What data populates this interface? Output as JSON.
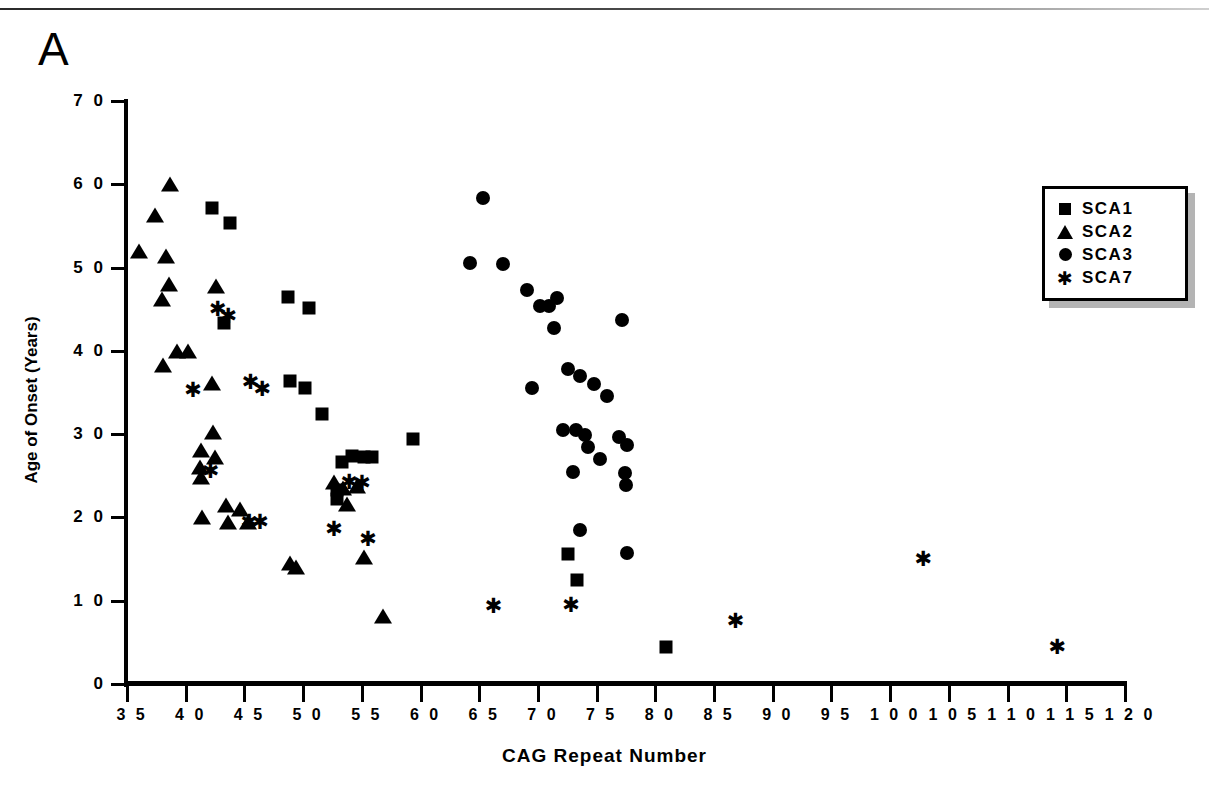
{
  "panel_label": "A",
  "chart_data": {
    "type": "scatter",
    "title": "",
    "xlabel": "CAG Repeat Number",
    "ylabel": "Age of Onset (Years)",
    "xlim": [
      35,
      120
    ],
    "ylim": [
      0,
      70
    ],
    "xticks": [
      35,
      40,
      45,
      50,
      55,
      60,
      65,
      70,
      75,
      80,
      85,
      90,
      95,
      100,
      105,
      110,
      115,
      120
    ],
    "yticks": [
      0,
      10,
      20,
      30,
      40,
      50,
      60,
      70
    ],
    "xtick_labels": [
      "3 5",
      "4 0",
      "4 5",
      "5 0",
      "5 5",
      "6 0",
      "6 5",
      "7 0",
      "7 5",
      "8 0",
      "8 5",
      "9 0",
      "9 5",
      "1 0 0",
      "1 0 5",
      "1 1 0",
      "1 1 5",
      "1 2 0"
    ],
    "ytick_labels": [
      "0",
      "1 0",
      "2 0",
      "3 0",
      "4 0",
      "5 0",
      "6 0",
      "7 0"
    ],
    "grid": false,
    "legend_position": "top-right",
    "series": [
      {
        "name": "SCA1",
        "marker": "square",
        "color": "#000000",
        "points": [
          [
            42.2,
            57.2
          ],
          [
            43.8,
            55.3
          ],
          [
            43.3,
            43.3
          ],
          [
            48.7,
            46.5
          ],
          [
            50.5,
            45.2
          ],
          [
            48.9,
            36.4
          ],
          [
            50.2,
            35.5
          ],
          [
            51.6,
            32.4
          ],
          [
            52.9,
            23.3
          ],
          [
            52.9,
            22.2
          ],
          [
            53.3,
            26.6
          ],
          [
            54.2,
            27.4
          ],
          [
            55.2,
            27.3
          ],
          [
            55.9,
            27.3
          ],
          [
            59.4,
            29.4
          ],
          [
            72.6,
            15.6
          ],
          [
            73.3,
            12.5
          ],
          [
            80.9,
            4.4
          ]
        ]
      },
      {
        "name": "SCA2",
        "marker": "triangle",
        "color": "#000000",
        "points": [
          [
            36.0,
            52.0
          ],
          [
            37.4,
            56.3
          ],
          [
            38.7,
            60.0
          ],
          [
            38.3,
            51.4
          ],
          [
            38.6,
            48.0
          ],
          [
            38.0,
            46.2
          ],
          [
            38.1,
            38.3
          ],
          [
            39.3,
            40.0
          ],
          [
            40.2,
            40.0
          ],
          [
            41.3,
            28.1
          ],
          [
            41.2,
            26.0
          ],
          [
            41.3,
            24.9
          ],
          [
            41.4,
            20.0
          ],
          [
            42.6,
            47.8
          ],
          [
            42.2,
            36.2
          ],
          [
            42.3,
            30.3
          ],
          [
            42.5,
            27.3
          ],
          [
            43.4,
            21.5
          ],
          [
            43.6,
            19.5
          ],
          [
            44.6,
            21.0
          ],
          [
            45.3,
            19.4
          ],
          [
            48.9,
            14.5
          ],
          [
            49.4,
            14.1
          ],
          [
            52.6,
            24.3
          ],
          [
            53.4,
            23.5
          ],
          [
            53.7,
            21.6
          ],
          [
            54.6,
            23.8
          ],
          [
            55.2,
            15.3
          ],
          [
            56.8,
            8.2
          ]
        ]
      },
      {
        "name": "SCA3",
        "marker": "circle",
        "color": "#000000",
        "points": [
          [
            65.3,
            58.4
          ],
          [
            64.2,
            50.5
          ],
          [
            67.0,
            50.4
          ],
          [
            69.1,
            47.3
          ],
          [
            70.2,
            45.4
          ],
          [
            70.9,
            45.4
          ],
          [
            71.6,
            46.4
          ],
          [
            71.4,
            42.7
          ],
          [
            77.2,
            43.7
          ],
          [
            69.5,
            35.6
          ],
          [
            72.6,
            37.8
          ],
          [
            73.6,
            37.0
          ],
          [
            74.8,
            36.0
          ],
          [
            75.9,
            34.6
          ],
          [
            72.1,
            30.5
          ],
          [
            73.2,
            30.5
          ],
          [
            74.0,
            29.9
          ],
          [
            74.3,
            28.5
          ],
          [
            75.3,
            27.0
          ],
          [
            73.0,
            25.5
          ],
          [
            76.9,
            29.7
          ],
          [
            77.6,
            28.7
          ],
          [
            77.4,
            25.3
          ],
          [
            77.5,
            23.9
          ],
          [
            73.6,
            18.5
          ],
          [
            77.6,
            15.7
          ]
        ]
      },
      {
        "name": "SCA7",
        "marker": "asterisk",
        "color": "#000000",
        "points": [
          [
            40.6,
            35.3
          ],
          [
            42.7,
            45.0
          ],
          [
            43.6,
            44.2
          ],
          [
            45.5,
            36.3
          ],
          [
            46.5,
            35.4
          ],
          [
            42.1,
            25.6
          ],
          [
            45.4,
            19.4
          ],
          [
            46.3,
            19.4
          ],
          [
            53.9,
            24.3
          ],
          [
            55.0,
            24.1
          ],
          [
            55.5,
            17.4
          ],
          [
            52.6,
            18.6
          ],
          [
            66.2,
            9.4
          ],
          [
            72.8,
            9.5
          ],
          [
            86.8,
            7.6
          ],
          [
            102.8,
            15.0
          ],
          [
            114.2,
            4.5
          ]
        ]
      }
    ]
  },
  "legend": {
    "items": [
      {
        "label": "SCA1",
        "marker": "square"
      },
      {
        "label": "SCA2",
        "marker": "triangle"
      },
      {
        "label": "SCA3",
        "marker": "circle"
      },
      {
        "label": "SCA7",
        "marker": "asterisk"
      }
    ]
  }
}
